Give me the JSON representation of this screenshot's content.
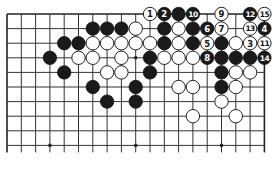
{
  "diagram": {
    "type": "go-board-fragment",
    "board_size": 19,
    "visible_rows": 10,
    "columns": 19,
    "top_edge": true,
    "left_edge": true,
    "right_edge": true,
    "bottom_open": true,
    "colors": {
      "black": "#1a1a1a",
      "white": "#ffffff",
      "line": "#333333",
      "background": "#ffffff"
    },
    "hoshi": [
      {
        "col": 9,
        "row": 3
      },
      {
        "col": 3,
        "row": 9
      },
      {
        "col": 9,
        "row": 9
      },
      {
        "col": 15,
        "row": 9
      }
    ],
    "stones": [
      {
        "col": 6,
        "row": 1,
        "color": "black"
      },
      {
        "col": 7,
        "row": 1,
        "color": "black"
      },
      {
        "col": 8,
        "row": 1,
        "color": "black"
      },
      {
        "col": 9,
        "row": 1,
        "color": "white"
      },
      {
        "col": 4,
        "row": 2,
        "color": "black"
      },
      {
        "col": 5,
        "row": 2,
        "color": "black"
      },
      {
        "col": 6,
        "row": 2,
        "color": "white"
      },
      {
        "col": 7,
        "row": 2,
        "color": "white"
      },
      {
        "col": 8,
        "row": 2,
        "color": "white"
      },
      {
        "col": 9,
        "row": 2,
        "color": "white"
      },
      {
        "col": 10,
        "row": 2,
        "color": "white"
      },
      {
        "col": 3,
        "row": 3,
        "color": "black"
      },
      {
        "col": 5,
        "row": 3,
        "color": "white"
      },
      {
        "col": 6,
        "row": 3,
        "color": "white"
      },
      {
        "col": 8,
        "row": 3,
        "color": "white"
      },
      {
        "col": 10,
        "row": 3,
        "color": "black"
      },
      {
        "col": 4,
        "row": 4,
        "color": "black"
      },
      {
        "col": 7,
        "row": 4,
        "color": "white"
      },
      {
        "col": 8,
        "row": 4,
        "color": "white"
      },
      {
        "col": 10,
        "row": 4,
        "color": "black"
      },
      {
        "col": 6,
        "row": 5,
        "color": "black"
      },
      {
        "col": 9,
        "row": 5,
        "color": "black"
      },
      {
        "col": 7,
        "row": 6,
        "color": "black"
      },
      {
        "col": 9,
        "row": 6,
        "color": "black"
      },
      {
        "col": 10,
        "row": 0,
        "color": "white",
        "label": "1"
      },
      {
        "col": 11,
        "row": 0,
        "color": "black",
        "label": "2"
      },
      {
        "col": 12,
        "row": 0,
        "color": "black"
      },
      {
        "col": 13,
        "row": 0,
        "color": "black",
        "label": "10"
      },
      {
        "col": 15,
        "row": 0,
        "color": "white",
        "label": "9"
      },
      {
        "col": 17,
        "row": 0,
        "color": "black",
        "label": "12"
      },
      {
        "col": 18,
        "row": 0,
        "color": "white",
        "label": "15"
      },
      {
        "col": 11,
        "row": 1,
        "color": "black"
      },
      {
        "col": 12,
        "row": 1,
        "color": "white"
      },
      {
        "col": 13,
        "row": 1,
        "color": "black"
      },
      {
        "col": 14,
        "row": 1,
        "color": "black",
        "label": "6"
      },
      {
        "col": 15,
        "row": 1,
        "color": "white",
        "label": "7"
      },
      {
        "col": 17,
        "row": 1,
        "color": "white",
        "label": "13"
      },
      {
        "col": 18,
        "row": 1,
        "color": "black",
        "label": "4"
      },
      {
        "col": 11,
        "row": 2,
        "color": "black"
      },
      {
        "col": 12,
        "row": 2,
        "color": "white"
      },
      {
        "col": 13,
        "row": 2,
        "color": "black"
      },
      {
        "col": 14,
        "row": 2,
        "color": "white",
        "label": "5"
      },
      {
        "col": 15,
        "row": 2,
        "color": "black"
      },
      {
        "col": 16,
        "row": 2,
        "color": "white"
      },
      {
        "col": 17,
        "row": 2,
        "color": "white",
        "label": "3"
      },
      {
        "col": 18,
        "row": 2,
        "color": "white",
        "label": "11"
      },
      {
        "col": 11,
        "row": 3,
        "color": "white"
      },
      {
        "col": 12,
        "row": 3,
        "color": "white"
      },
      {
        "col": 13,
        "row": 3,
        "color": "white"
      },
      {
        "col": 14,
        "row": 3,
        "color": "black",
        "label": "8"
      },
      {
        "col": 15,
        "row": 3,
        "color": "black"
      },
      {
        "col": 16,
        "row": 3,
        "color": "black"
      },
      {
        "col": 17,
        "row": 3,
        "color": "black"
      },
      {
        "col": 18,
        "row": 3,
        "color": "black",
        "label": "14"
      },
      {
        "col": 15,
        "row": 4,
        "color": "black"
      },
      {
        "col": 16,
        "row": 4,
        "color": "white"
      },
      {
        "col": 17,
        "row": 4,
        "color": "white"
      },
      {
        "col": 12,
        "row": 5,
        "color": "white"
      },
      {
        "col": 13,
        "row": 5,
        "color": "white"
      },
      {
        "col": 15,
        "row": 5,
        "color": "black"
      },
      {
        "col": 16,
        "row": 5,
        "color": "white"
      },
      {
        "col": 15,
        "row": 6,
        "color": "white"
      },
      {
        "col": 13,
        "row": 7,
        "color": "white"
      },
      {
        "col": 16,
        "row": 7,
        "color": "white"
      }
    ]
  }
}
